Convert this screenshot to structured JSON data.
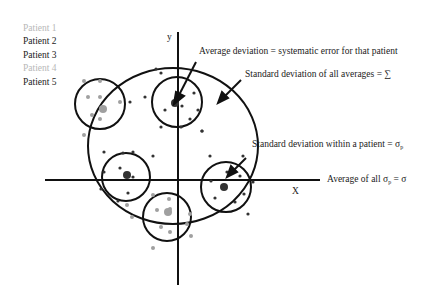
{
  "legend": [
    {
      "label": "Patient 1",
      "color": "#b8b8b8"
    },
    {
      "label": "Patient 2",
      "color": "#222222"
    },
    {
      "label": "Patient 3",
      "color": "#222222"
    },
    {
      "label": "Patient 4",
      "color": "#b8b8b8"
    },
    {
      "label": "Patient 5",
      "color": "#222222"
    }
  ],
  "axes": {
    "x_label": "X",
    "y_label": "y"
  },
  "annotations": {
    "avg_deviation": "Average deviation = systematic error for that patient",
    "sd_averages": "Standard deviation of all averages = ∑",
    "sd_within_prefix": "Standard deviation within a patient = σ",
    "sd_within_sub": "p",
    "avg_sigma_prefix": "Average of all σ",
    "avg_sigma_sub": "p",
    "avg_sigma_suffix": " = σ"
  },
  "colors": {
    "line": "#111111",
    "light_dot": "#a0a0a0",
    "dark_dot": "#333333"
  }
}
